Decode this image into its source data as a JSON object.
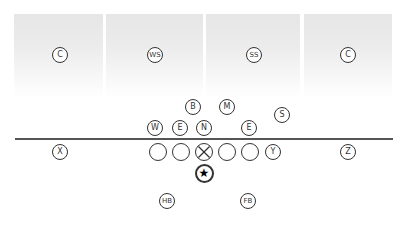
{
  "diagram": {
    "type": "football-formation",
    "colors": {
      "line": "#555555",
      "stroke": "#333333",
      "zone_top": "#e6e6e6",
      "zone_bottom": "#ffffff"
    },
    "coverage_zones": [
      {
        "label": "C",
        "x": 14,
        "w": 89
      },
      {
        "label": "WS",
        "x": 106,
        "w": 97
      },
      {
        "label": "SS",
        "x": 206,
        "w": 94
      },
      {
        "label": "C",
        "x": 304,
        "w": 88
      }
    ],
    "defense": [
      {
        "label": "C",
        "x": 60,
        "y": 55
      },
      {
        "label": "WS",
        "x": 155,
        "y": 55
      },
      {
        "label": "SS",
        "x": 254,
        "y": 55
      },
      {
        "label": "C",
        "x": 348,
        "y": 55
      },
      {
        "label": "B",
        "x": 193,
        "y": 107
      },
      {
        "label": "M",
        "x": 227,
        "y": 107
      },
      {
        "label": "S",
        "x": 282,
        "y": 115
      },
      {
        "label": "W",
        "x": 155,
        "y": 128
      },
      {
        "label": "E",
        "x": 180,
        "y": 128
      },
      {
        "label": "N",
        "x": 204,
        "y": 128
      },
      {
        "label": "E",
        "x": 249,
        "y": 128
      }
    ],
    "offense": {
      "receivers": [
        {
          "label": "X",
          "x": 60,
          "y": 152
        },
        {
          "label": "Y",
          "x": 273,
          "y": 152
        },
        {
          "label": "Z",
          "x": 348,
          "y": 152
        }
      ],
      "line": [
        {
          "x": 158,
          "y": 152,
          "center": false
        },
        {
          "x": 181,
          "y": 152,
          "center": false
        },
        {
          "x": 204,
          "y": 152,
          "center": true
        },
        {
          "x": 227,
          "y": 152,
          "center": false
        },
        {
          "x": 250,
          "y": 152,
          "center": false
        }
      ],
      "quarterback": {
        "symbol": "★",
        "x": 204,
        "y": 173
      },
      "backs": [
        {
          "label": "HB",
          "x": 167,
          "y": 201
        },
        {
          "label": "FB",
          "x": 248,
          "y": 201
        }
      ]
    }
  }
}
